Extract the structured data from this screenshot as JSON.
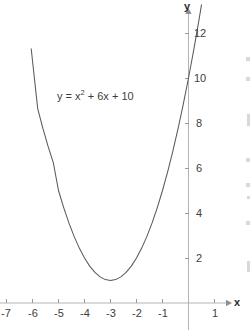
{
  "figure": {
    "kind": "cartesian-graph",
    "background_color": "#ffffff",
    "curve_color": "#5a5a5a",
    "axis_color": "#b3b3b3",
    "tick_color": "#9a9a9a",
    "text_color": "#3d3d3d"
  },
  "annotation": {
    "equation_prefix": "y = x",
    "equation_exponent": "2",
    "equation_suffix": " + 6x + 10",
    "equation_plain": "y = x² + 6x + 10"
  },
  "axes": {
    "x_axis_name": "x",
    "y_axis_name": "y",
    "x_tick_labels": [
      "-7",
      "-6",
      "-5",
      "-4",
      "-3",
      "-2",
      "-1",
      "1"
    ],
    "y_tick_labels": [
      "2",
      "4",
      "6",
      "8",
      "10",
      "12"
    ]
  },
  "chart_data": {
    "type": "line",
    "title": "",
    "subtitle": "",
    "xlabel": "x",
    "ylabel": "y",
    "annotations": [
      "y = x² + 6x + 10"
    ],
    "grid": false,
    "legend": false,
    "legend_position": "none",
    "xlim": [
      -7.3,
      1.6
    ],
    "ylim": [
      0,
      13
    ],
    "x_ticks": [
      -7,
      -6,
      -5,
      -4,
      -3,
      -2,
      -1,
      1
    ],
    "y_ticks": [
      2,
      4,
      6,
      8,
      10,
      12
    ],
    "x_tick_labels": [
      "-7",
      "-6",
      "-5",
      "-4",
      "-3",
      "-2",
      "-1",
      "1"
    ],
    "y_tick_labels": [
      "2",
      "4",
      "6",
      "8",
      "10",
      "12"
    ],
    "series": [
      {
        "name": "y = x² + 6x + 10",
        "equation": "y = x^2 + 6x + 10",
        "color": "#5a5a5a",
        "vertex": [
          -3,
          1
        ],
        "y_intercept": [
          0,
          10
        ],
        "x": [
          -6.05,
          -5.8,
          -5.6,
          -5.4,
          -5.2,
          -5.0,
          -4.8,
          -4.6,
          -4.4,
          -4.2,
          -4.0,
          -3.8,
          -3.6,
          -3.4,
          -3.2,
          -3.0,
          -2.8,
          -2.6,
          -2.4,
          -2.2,
          -2.0,
          -1.8,
          -1.6,
          -1.4,
          -1.2,
          -1.0,
          -0.8,
          -0.6,
          -0.4,
          -0.2,
          0.0,
          0.2,
          0.4,
          0.5
        ],
        "y": [
          11.3,
          8.64,
          7.76,
          6.96,
          6.24,
          5.0,
          4.24,
          3.56,
          2.96,
          2.44,
          2.0,
          1.64,
          1.36,
          1.16,
          1.04,
          1.0,
          1.04,
          1.16,
          1.36,
          1.64,
          2.0,
          2.44,
          2.96,
          3.56,
          4.24,
          5.0,
          5.84,
          6.76,
          7.76,
          8.84,
          10.0,
          11.24,
          12.56,
          13.25
        ]
      }
    ]
  }
}
